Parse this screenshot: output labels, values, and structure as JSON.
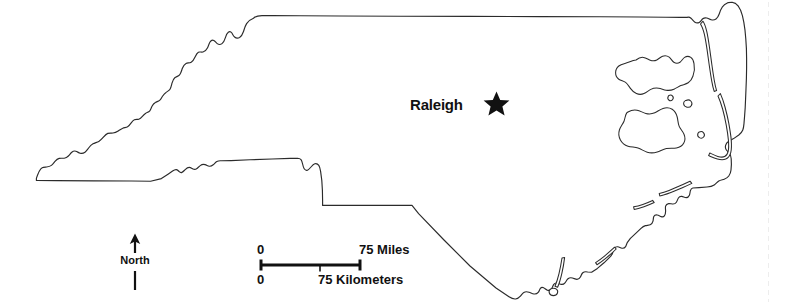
{
  "map": {
    "title": "North Carolina",
    "background_color": "#ffffff",
    "outline_color": "#2b2b2b",
    "capital": {
      "name": "Raleigh",
      "marker": "star-icon",
      "marker_color": "#111111",
      "label_x": 410,
      "label_y": 97,
      "marker_x": 483,
      "marker_y": 91
    },
    "north_arrow": {
      "label": "North",
      "direction": "up"
    },
    "scale_bar": {
      "miles": {
        "start_label": "0",
        "end_label": "75 Miles"
      },
      "kilometers": {
        "start_label": "0",
        "end_label": "75 Kilometers"
      },
      "bar_color": "#111111"
    },
    "features": {
      "state_outline": "north-carolina-state-boundary",
      "barrier_islands": [
        "outer-banks-north",
        "outer-banks-hatteras",
        "core-banks",
        "bogue-banks",
        "topsail-island",
        "bald-head-island",
        "sound-island-a",
        "sound-island-b",
        "sound-island-c"
      ]
    }
  }
}
